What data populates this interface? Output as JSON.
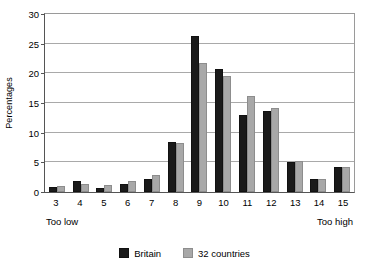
{
  "chart_data": {
    "type": "bar",
    "title": "",
    "subtitle": "",
    "xlabel": "",
    "ylabel": "Percentages",
    "ylim": [
      0,
      30
    ],
    "yticks": [
      0,
      5,
      10,
      15,
      20,
      25,
      30
    ],
    "grid": true,
    "legend_position": "bottom",
    "categories": [
      "3",
      "4",
      "5",
      "6",
      "7",
      "8",
      "9",
      "10",
      "11",
      "12",
      "13",
      "14",
      "15"
    ],
    "series": [
      {
        "name": "Britain",
        "color": "#1a1a1a",
        "values": [
          0.9,
          1.9,
          0.6,
          1.3,
          2.2,
          8.4,
          26.3,
          20.7,
          13.0,
          13.7,
          5.0,
          2.2,
          4.2
        ]
      },
      {
        "name": "32 countries",
        "color": "#a8a8a8",
        "values": [
          1.0,
          1.4,
          1.2,
          1.8,
          2.8,
          8.3,
          21.7,
          19.6,
          16.1,
          14.2,
          5.3,
          2.2,
          4.3
        ]
      }
    ],
    "annotations": {
      "axis_low": "Too low",
      "axis_high": "Too high"
    }
  }
}
